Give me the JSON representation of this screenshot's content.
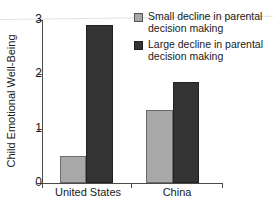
{
  "chart_data": {
    "type": "bar",
    "title": "",
    "xlabel": "",
    "ylabel": "Child Emotional Well-Being",
    "ylim": [
      0,
      3
    ],
    "yticks": [
      "0",
      "1",
      "2",
      "3"
    ],
    "grid": false,
    "legend_position": "top-right",
    "categories": [
      "United States",
      "China"
    ],
    "series": [
      {
        "name": "Small decline in parental decision making",
        "color": "#a8a8a8",
        "values": [
          0.5,
          1.35
        ]
      },
      {
        "name": "Large decline in parental decision making",
        "color": "#333333",
        "values": [
          2.9,
          1.85
        ]
      }
    ]
  },
  "legend": {
    "items": [
      {
        "label": "Small decline in parental decision making",
        "swatch": "small-decline-swatch"
      },
      {
        "label": "Large decline in parental decision making",
        "swatch": "large-decline-swatch"
      }
    ]
  }
}
